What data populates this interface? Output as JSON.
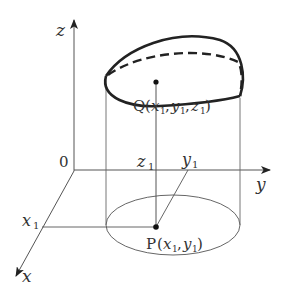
{
  "diagram": {
    "type": "3d-coordinate-cylinder",
    "axes": {
      "x": "x",
      "y": "y",
      "z": "z",
      "origin": "0"
    },
    "points": {
      "Q": {
        "name": "Q",
        "open": "(",
        "x": "x",
        "y": "y",
        "z": "z",
        "sub": "1",
        "label_full": "Q(x1, y1, z1)"
      },
      "P": {
        "name": "P",
        "x": "x",
        "y": "y",
        "sub": "1",
        "label_full": "P(x1, y1)"
      }
    },
    "tick_labels": {
      "x1": "x",
      "y1": "y",
      "z1": "z",
      "sub": "1"
    },
    "colors": {
      "axis": "#555555",
      "curve": "#222222",
      "thin": "#666666",
      "text": "#333333"
    }
  }
}
